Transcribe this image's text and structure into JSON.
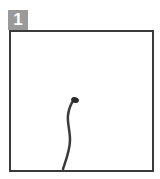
{
  "panel": {
    "number": "1",
    "badge_color": "#9a9a9a",
    "border_color": "#3a3a3a",
    "drawing": "sprouting stem with small bud"
  }
}
